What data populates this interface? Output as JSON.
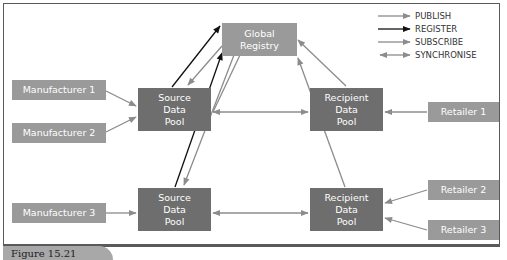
{
  "figure": {
    "caption": "Figure 15.21"
  },
  "nodes": {
    "global_registry": {
      "line1": "Global",
      "line2": "Registry"
    },
    "manufacturer_1": "Manufacturer 1",
    "manufacturer_2": "Manufacturer 2",
    "manufacturer_3": "Manufacturer 3",
    "source_pool_top": {
      "line1": "Source",
      "line2": "Data",
      "line3": "Pool"
    },
    "source_pool_bottom": {
      "line1": "Source",
      "line2": "Data",
      "line3": "Pool"
    },
    "recipient_pool_top": {
      "line1": "Recipient",
      "line2": "Data",
      "line3": "Pool"
    },
    "recipient_pool_bottom": {
      "line1": "Recipient",
      "line2": "Data",
      "line3": "Pool"
    },
    "retailer_1": "Retailer 1",
    "retailer_2": "Retailer 2",
    "retailer_3": "Retailer 3"
  },
  "legend": {
    "items": [
      {
        "label": "PUBLISH",
        "style": "grey-arrow"
      },
      {
        "label": "REGISTER",
        "style": "black-arrow"
      },
      {
        "label": "SUBSCRIBE",
        "style": "grey-arrow"
      },
      {
        "label": "SYNCHRONISE",
        "style": "double-grey-arrow"
      }
    ]
  },
  "colors": {
    "light_box": "#9a9a9a",
    "dark_box": "#6e6e6e",
    "grey_arrow": "#8c8c8c",
    "black_arrow": "#111111",
    "frame": "#5a5a5a"
  }
}
